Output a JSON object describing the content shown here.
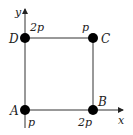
{
  "diagram": {
    "type": "charge-configuration-square",
    "axes": {
      "x_label": "x",
      "y_label": "y"
    },
    "points": [
      {
        "name": "A",
        "charge": "p"
      },
      {
        "name": "B",
        "charge": "2p"
      },
      {
        "name": "C",
        "charge": "p"
      },
      {
        "name": "D",
        "charge": "2p"
      }
    ],
    "colors": {
      "line": "#333333",
      "point": "#000000",
      "text": "#222222"
    }
  }
}
